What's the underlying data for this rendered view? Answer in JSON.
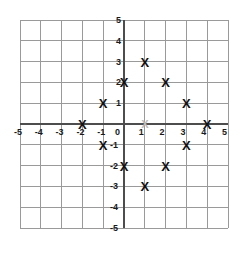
{
  "chart_data": {
    "type": "scatter",
    "title": "",
    "xlabel": "",
    "ylabel": "",
    "xlim": [
      -5,
      5
    ],
    "ylim": [
      -5,
      5
    ],
    "grid": true,
    "legend": "none",
    "marker_symbol": "X",
    "x_ticks": [
      "-5",
      "-4",
      "-3",
      "-2",
      "-1",
      "0",
      "1",
      "2",
      "3",
      "4",
      "5"
    ],
    "y_ticks": [
      "5",
      "4",
      "3",
      "2",
      "1",
      "0",
      "-1",
      "-2",
      "-3",
      "-4",
      "-5"
    ],
    "points": [
      {
        "x": -2,
        "y": 0,
        "label": "X"
      },
      {
        "x": -1,
        "y": 1,
        "label": "X"
      },
      {
        "x": -1,
        "y": -1,
        "label": "X"
      },
      {
        "x": 0,
        "y": 2,
        "label": "X"
      },
      {
        "x": 0,
        "y": -2,
        "label": "X"
      },
      {
        "x": 1,
        "y": 3,
        "label": "X"
      },
      {
        "x": 1,
        "y": -3,
        "label": "X"
      },
      {
        "x": 2,
        "y": 2,
        "label": "X"
      },
      {
        "x": 2,
        "y": -2,
        "label": "X"
      },
      {
        "x": 3,
        "y": 1,
        "label": "X"
      },
      {
        "x": 3,
        "y": -1,
        "label": "X"
      },
      {
        "x": 4,
        "y": 0,
        "label": "X"
      }
    ],
    "faint_points": [
      {
        "x": 1,
        "y": 0,
        "label": "X"
      }
    ],
    "colors": {
      "marker": "#111111",
      "faint_marker": "#b9b9b9",
      "axis": "#4d4d4d",
      "grid": "#9a9a9a",
      "label": "#1a1a1a",
      "background": "#ffffff"
    }
  }
}
